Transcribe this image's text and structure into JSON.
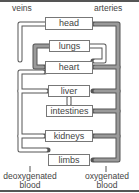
{
  "labels": {
    "veins": "veins",
    "arteries": "arteries",
    "deoxygenated_line1": "deoxygenated",
    "deoxygenated_line2": "blood",
    "oxygenated_line1": "oxygenated",
    "oxygenated_line2": "blood"
  },
  "organs": [
    {
      "id": "head",
      "label": "head"
    },
    {
      "id": "lungs",
      "label": "lungs"
    },
    {
      "id": "heart",
      "label": "heart"
    },
    {
      "id": "liver",
      "label": "liver"
    },
    {
      "id": "intestines",
      "label": "intestines"
    },
    {
      "id": "kidneys",
      "label": "kidneys"
    },
    {
      "id": "limbs",
      "label": "limbs"
    }
  ],
  "colors": {
    "deoxygenated_pipe": "#ffffff",
    "oxygenated_pipe": "#999999",
    "outline": "#555555"
  }
}
